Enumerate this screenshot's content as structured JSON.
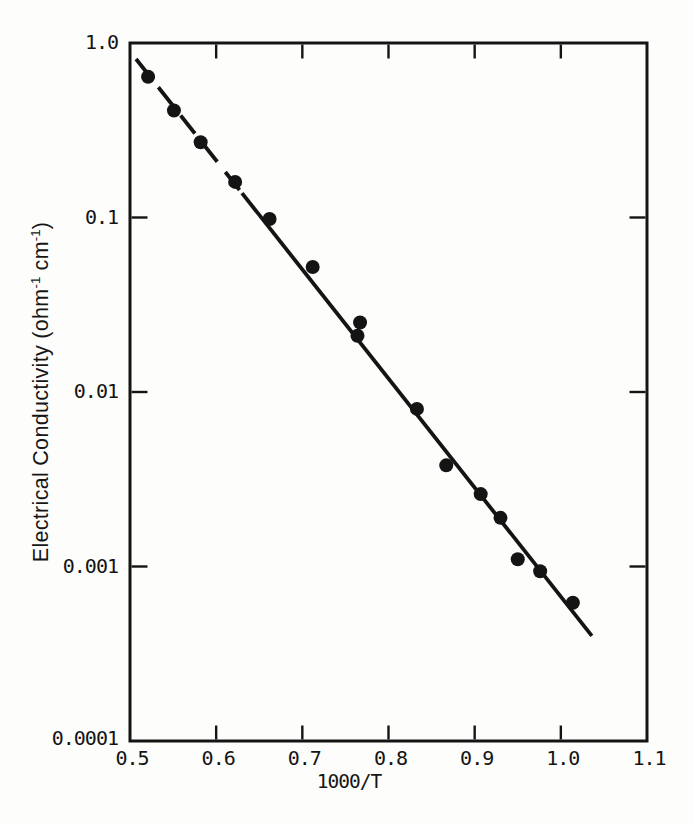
{
  "figure": {
    "background": "#fdfdfc",
    "ink_color": "#141414",
    "width": 694,
    "height": 825
  },
  "chart_data": {
    "type": "scatter",
    "title": "",
    "xlabel": "1000/T",
    "ylabel": "Electrical Conductivity (ohm⁻¹ cm⁻¹)",
    "ylabel_parts": {
      "p1": "Electrical Conductivity (ohm",
      "s1": "-1",
      "p2": " cm",
      "s2": "-1",
      "p3": ")"
    },
    "x_axis": {
      "min": 0.5,
      "max": 1.1,
      "scale": "linear",
      "tick_values": [
        0.5,
        0.6,
        0.7,
        0.8,
        0.9,
        1.0,
        1.1
      ],
      "tick_labels": [
        "0.5",
        "0.6",
        "0.7",
        "0.8",
        "0.9",
        "1.0",
        "1.1"
      ],
      "inner_tick_values": [
        0.6,
        0.7,
        0.8,
        0.9,
        1.0
      ]
    },
    "y_axis": {
      "min": 0.0001,
      "max": 1.0,
      "scale": "log",
      "tick_values": [
        1.0,
        0.1,
        0.01,
        0.001,
        0.0001
      ],
      "tick_labels": [
        "1.0",
        "0.1",
        "0.01",
        "0.001",
        "0.0001"
      ],
      "inner_tick_values": [
        0.1,
        0.01,
        0.001
      ]
    },
    "grid": false,
    "legend": null,
    "marker": {
      "shape": "filled-circle",
      "radius_px": 7
    },
    "points": [
      [
        0.521,
        0.64
      ],
      [
        0.551,
        0.41
      ],
      [
        0.582,
        0.27
      ],
      [
        0.622,
        0.16
      ],
      [
        0.662,
        0.098
      ],
      [
        0.712,
        0.052
      ],
      [
        0.764,
        0.021
      ],
      [
        0.767,
        0.025
      ],
      [
        0.833,
        0.008
      ],
      [
        0.867,
        0.0038
      ],
      [
        0.907,
        0.0026
      ],
      [
        0.93,
        0.0019
      ],
      [
        0.95,
        0.0011
      ],
      [
        0.976,
        0.00094
      ],
      [
        1.014,
        0.00062
      ]
    ],
    "fit_line": {
      "x_start": 0.507,
      "y_start": 0.81,
      "x_end": 1.036,
      "y_end": 0.0004,
      "dash_until_x": 0.63,
      "description": "straight line on log scale, dashed at upper-left then solid"
    }
  }
}
